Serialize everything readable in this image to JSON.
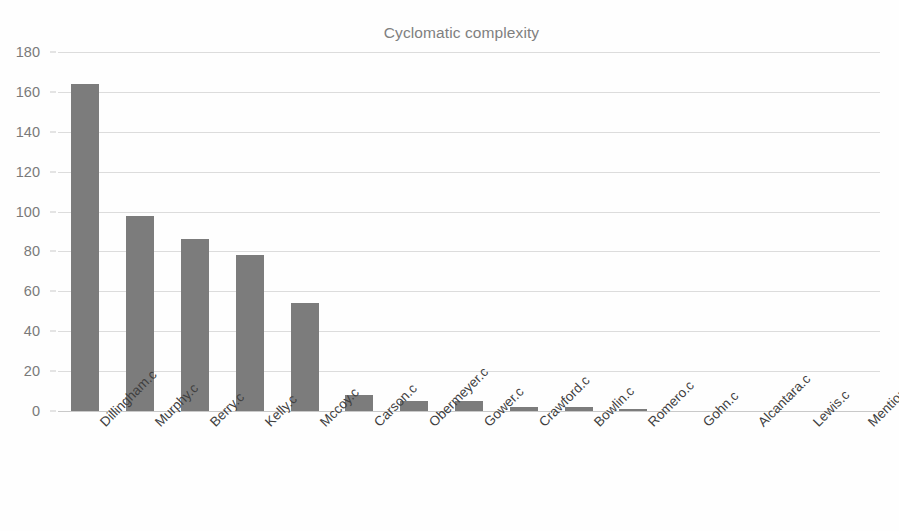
{
  "chart_data": {
    "type": "bar",
    "title": "Cyclomatic complexity",
    "xlabel": "",
    "ylabel": "",
    "ylim": [
      0,
      180
    ],
    "ytick_step": 20,
    "yticks": [
      0,
      20,
      40,
      60,
      80,
      100,
      120,
      140,
      160,
      180
    ],
    "grid": true,
    "legend": null,
    "legend_position": "none",
    "bar_color": "#7c7c7c",
    "gridline_color": "#dcdcdc",
    "title_color": "#808080",
    "tick_label_color": "#7a7a7a",
    "category_label_color": "#3f3f3f",
    "category_label_rotation": -45,
    "categories": [
      "Dillingham.c",
      "Murphy.c",
      "Berry.c",
      "Kelly.c",
      "Mccoy.c",
      "Carson.c",
      "Obermeyer.c",
      "Gower.c",
      "Crawford.c",
      "Bowlin.c",
      "Romero.c",
      "Gohn.c",
      "Alcantara.c",
      "Lewis.c",
      "Mention.c"
    ],
    "values": [
      164,
      98,
      86,
      78,
      54,
      8,
      5,
      5,
      2,
      2,
      1,
      0,
      0,
      0,
      0
    ]
  }
}
